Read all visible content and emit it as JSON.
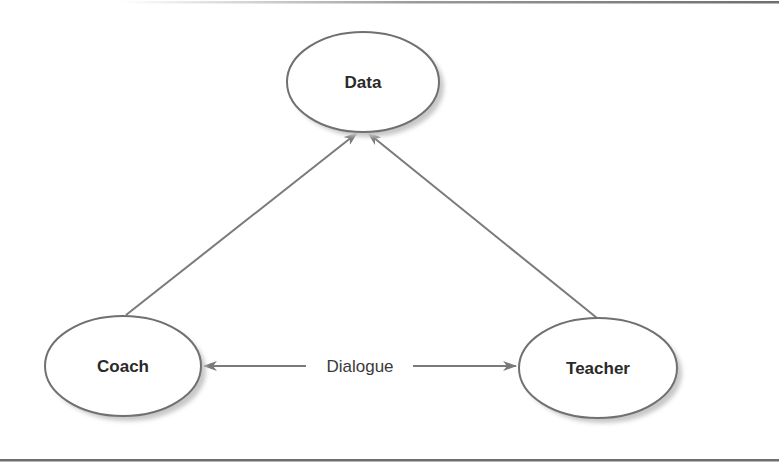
{
  "diagram": {
    "type": "relationship-triangle",
    "colors": {
      "stroke": "#707070",
      "arrow": "#7a7a7a",
      "shadow": "#c8c8c8",
      "text": "#2a2a2a",
      "border": "#6e6e6e",
      "fill": "#ffffff"
    },
    "nodes": [
      {
        "id": "data",
        "label": "Data"
      },
      {
        "id": "coach",
        "label": "Coach"
      },
      {
        "id": "teacher",
        "label": "Teacher"
      }
    ],
    "edges": [
      {
        "from": "coach",
        "to": "data",
        "direction": "forward",
        "label": ""
      },
      {
        "from": "teacher",
        "to": "data",
        "direction": "forward",
        "label": ""
      },
      {
        "from": "coach",
        "to": "teacher",
        "direction": "bidirectional",
        "label": "Dialogue"
      }
    ]
  }
}
